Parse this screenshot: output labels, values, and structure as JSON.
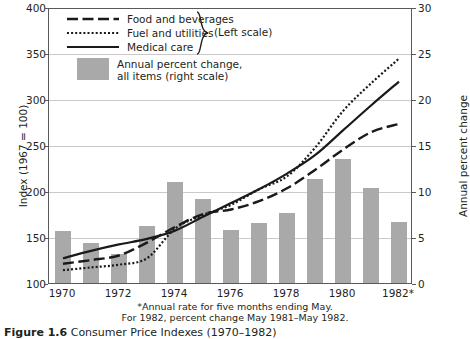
{
  "chart_data": {
    "type": "line",
    "title": "Consumer Price Indexes (1970–1982)",
    "xlabel": "",
    "ylabel": "Index (1967 = 100)",
    "ylabel_right": "Annual percent change",
    "ylim": [
      100,
      400
    ],
    "ylim_right": [
      0,
      30
    ],
    "grid": true,
    "legend_position": "upper-left",
    "x": [
      1970,
      1971,
      1972,
      1973,
      1974,
      1975,
      1976,
      1977,
      1978,
      1979,
      1980,
      1981,
      1982
    ],
    "xticks": [
      "1970",
      "1972",
      "1974",
      "1976",
      "1978",
      "1980",
      "1982*"
    ],
    "xtick_values": [
      1970,
      1972,
      1974,
      1976,
      1978,
      1980,
      1982
    ],
    "yticks_left": [
      100,
      150,
      200,
      250,
      300,
      350,
      400
    ],
    "yticks_right": [
      0,
      5,
      10,
      15,
      20,
      25,
      30
    ],
    "series": [
      {
        "name": "Food and beverages",
        "style": "dashed",
        "scale": "left",
        "values": [
          122,
          126,
          131,
          145,
          162,
          176,
          181,
          190,
          204,
          224,
          246,
          265,
          274
        ]
      },
      {
        "name": "Fuel and utilities",
        "style": "dotted",
        "scale": "left",
        "values": [
          115,
          118,
          121,
          128,
          160,
          175,
          186,
          203,
          217,
          248,
          288,
          318,
          345
        ]
      },
      {
        "name": "Medical care",
        "style": "solid",
        "scale": "left",
        "values": [
          128,
          136,
          143,
          149,
          158,
          173,
          188,
          203,
          220,
          240,
          267,
          294,
          320
        ]
      }
    ],
    "bars": {
      "name": "Annual percent change, all items (right scale)",
      "scale": "right",
      "color": "#a9a9a9",
      "values": [
        5.7,
        4.4,
        3.2,
        6.2,
        11.0,
        9.1,
        5.8,
        6.5,
        7.6,
        11.3,
        13.5,
        10.3,
        6.6
      ]
    }
  },
  "legend": {
    "items": [
      {
        "label": "Food and beverages",
        "style": "dashed"
      },
      {
        "label": "Fuel and utilities",
        "style": "dotted"
      },
      {
        "label": "Medical care",
        "style": "solid"
      }
    ],
    "bracket_label": "(Left scale)",
    "bars_label_line1": "Annual percent change,",
    "bars_label_line2": "all items (right scale)"
  },
  "footnote": {
    "line1": "*Annual rate for five months ending May.",
    "line2": "For 1982, percent change May 1981–May 1982."
  },
  "caption": {
    "figure_number": "Figure 1.6",
    "figure_title": "Consumer Price Indexes (1970–1982)"
  },
  "colors": {
    "bar": "#a9a9a9",
    "line": "#1a1a1a",
    "grid": "#c9c9c9",
    "axis": "#58595b",
    "text": "#231f20"
  }
}
